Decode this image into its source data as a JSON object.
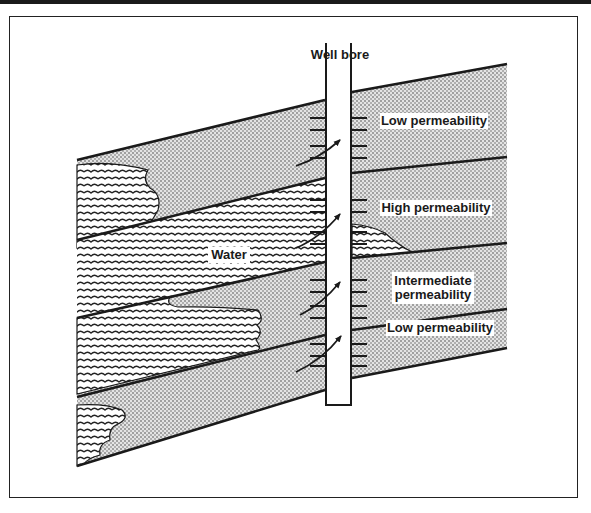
{
  "figure": {
    "well_bore_label": "Well bore",
    "water_label": "Water",
    "layers": [
      {
        "label": "Low permeability",
        "lines": [
          "Low permeability"
        ]
      },
      {
        "label": "High permeability",
        "lines": [
          "High permeability"
        ]
      },
      {
        "label": "Intermediate permeability",
        "lines": [
          "Intermediate",
          "permeability"
        ]
      },
      {
        "label": "Low permeability",
        "lines": [
          "Low permeability"
        ]
      }
    ],
    "colors": {
      "ink": "#1a1a1a",
      "sand_dot": "#3a3a3a",
      "background": "#ffffff"
    }
  }
}
